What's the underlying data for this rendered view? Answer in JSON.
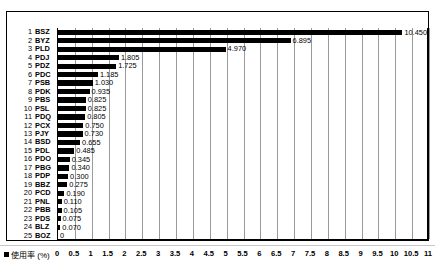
{
  "chart_data": {
    "type": "bar",
    "orientation": "horizontal",
    "title": "",
    "xlabel": "",
    "ylabel": "",
    "xlim": [
      0,
      11
    ],
    "xtick_step": 0.5,
    "grid": true,
    "legend_position": "bottom-left",
    "legend_label": "使用率 (%)",
    "legend_marker": "square-black",
    "bar_color": "#000000",
    "xticks": [
      "0",
      "0.5",
      "1",
      "1.5",
      "2",
      "2.5",
      "3",
      "3.5",
      "4",
      "4.5",
      "5",
      "5.5",
      "6",
      "6.5",
      "7",
      "7.5",
      "8",
      "8.5",
      "9",
      "9.5",
      "10",
      "10.5",
      "11"
    ],
    "xtick_values": [
      0,
      0.5,
      1,
      1.5,
      2,
      2.5,
      3,
      3.5,
      4,
      4.5,
      5,
      5.5,
      6,
      6.5,
      7,
      7.5,
      8,
      8.5,
      9,
      9.5,
      10,
      10.5,
      11
    ],
    "categories": [
      "1 BSZ",
      "2 BYZ",
      "3 PLD",
      "4 PDJ",
      "5 PDZ",
      "6 PDC",
      "7 PSB",
      "8 PDK",
      "9 PBS",
      "10 PSL",
      "11 PDQ",
      "12 PCX",
      "13 PJY",
      "14 BSD",
      "15 PDL",
      "16 PDO",
      "17 PBG",
      "18 PDP",
      "19 BBZ",
      "20 PCD",
      "21 PNL",
      "22 PBB",
      "23 PDS",
      "24 BLZ",
      "25 BOZ"
    ],
    "values": [
      10.45,
      6.895,
      4.97,
      1.805,
      1.725,
      1.185,
      1.03,
      0.935,
      0.825,
      0.825,
      0.805,
      0.75,
      0.73,
      0.655,
      0.485,
      0.345,
      0.34,
      0.3,
      0.275,
      0.19,
      0.11,
      0.105,
      0.075,
      0.07,
      0
    ],
    "value_labels": [
      "10.450",
      "6.895",
      "4.970",
      "1.805",
      "1.725",
      "1.185",
      "1.030",
      "0.935",
      "0.825",
      "0.825",
      "0.805",
      "0.750",
      "0.730",
      "0.655",
      "0.485",
      "0.345",
      "0.340",
      "0.300",
      "0.275",
      "0.190",
      "0.110",
      "0.105",
      "0.075",
      "0.070",
      "0"
    ],
    "rows": [
      {
        "rank": "1",
        "code": "BSZ",
        "value": 10.45,
        "label": "10.450"
      },
      {
        "rank": "2",
        "code": "BYZ",
        "value": 6.895,
        "label": "6.895"
      },
      {
        "rank": "3",
        "code": "PLD",
        "value": 4.97,
        "label": "4.970"
      },
      {
        "rank": "4",
        "code": "PDJ",
        "value": 1.805,
        "label": "1.805"
      },
      {
        "rank": "5",
        "code": "PDZ",
        "value": 1.725,
        "label": "1.725"
      },
      {
        "rank": "6",
        "code": "PDC",
        "value": 1.185,
        "label": "1.185"
      },
      {
        "rank": "7",
        "code": "PSB",
        "value": 1.03,
        "label": "1.030"
      },
      {
        "rank": "8",
        "code": "PDK",
        "value": 0.935,
        "label": "0.935"
      },
      {
        "rank": "9",
        "code": "PBS",
        "value": 0.825,
        "label": "0.825"
      },
      {
        "rank": "10",
        "code": "PSL",
        "value": 0.825,
        "label": "0.825"
      },
      {
        "rank": "11",
        "code": "PDQ",
        "value": 0.805,
        "label": "0.805"
      },
      {
        "rank": "12",
        "code": "PCX",
        "value": 0.75,
        "label": "0.750"
      },
      {
        "rank": "13",
        "code": "PJY",
        "value": 0.73,
        "label": "0.730"
      },
      {
        "rank": "14",
        "code": "BSD",
        "value": 0.655,
        "label": "0.655"
      },
      {
        "rank": "15",
        "code": "PDL",
        "value": 0.485,
        "label": "0.485"
      },
      {
        "rank": "16",
        "code": "PDO",
        "value": 0.345,
        "label": "0.345"
      },
      {
        "rank": "17",
        "code": "PBG",
        "value": 0.34,
        "label": "0.340"
      },
      {
        "rank": "18",
        "code": "PDP",
        "value": 0.3,
        "label": "0.300"
      },
      {
        "rank": "19",
        "code": "BBZ",
        "value": 0.275,
        "label": "0.275"
      },
      {
        "rank": "20",
        "code": "PCD",
        "value": 0.19,
        "label": "0.190"
      },
      {
        "rank": "21",
        "code": "PNL",
        "value": 0.11,
        "label": "0.110"
      },
      {
        "rank": "22",
        "code": "PBB",
        "value": 0.105,
        "label": "0.105"
      },
      {
        "rank": "23",
        "code": "PDS",
        "value": 0.075,
        "label": "0.075"
      },
      {
        "rank": "24",
        "code": "BLZ",
        "value": 0.07,
        "label": "0.070"
      },
      {
        "rank": "25",
        "code": "BOZ",
        "value": 0,
        "label": "0"
      }
    ]
  }
}
